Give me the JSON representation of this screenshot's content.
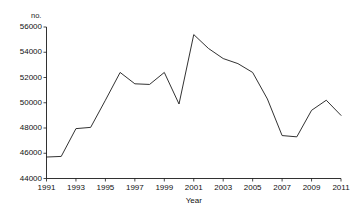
{
  "chart_data": {
    "type": "line",
    "title": "",
    "unit_label": "no.",
    "xlabel": "Year",
    "ylabel": "",
    "x": [
      1991,
      1992,
      1993,
      1994,
      1995,
      1996,
      1997,
      1998,
      1999,
      2000,
      2001,
      2002,
      2003,
      2004,
      2005,
      2006,
      2007,
      2008,
      2009,
      2010,
      2011
    ],
    "categories": [
      "1991",
      "1992",
      "1993",
      "1994",
      "1995",
      "1996",
      "1997",
      "1998",
      "1999",
      "2000",
      "2001",
      "2002",
      "2003",
      "2004",
      "2005",
      "2006",
      "2007",
      "2008",
      "2009",
      "2010",
      "2011"
    ],
    "values": [
      45700,
      45750,
      47950,
      48050,
      50200,
      52400,
      51500,
      51450,
      52400,
      49900,
      55400,
      54300,
      53500,
      53100,
      52400,
      50300,
      47400,
      47300,
      49400,
      50200,
      49000
    ],
    "xtick_labels": [
      "1991",
      "1993",
      "1995",
      "1997",
      "1999",
      "2001",
      "2003",
      "2005",
      "2007",
      "2009",
      "2011"
    ],
    "ytick_labels": [
      "44000",
      "46000",
      "48000",
      "50000",
      "52000",
      "54000",
      "56000"
    ],
    "ylim": [
      44000,
      56000
    ],
    "xlim": [
      1991,
      2011
    ],
    "grid": false,
    "legend": "none",
    "series": [
      {
        "name": "no.",
        "values": [
          45700,
          45750,
          47950,
          48050,
          50200,
          52400,
          51500,
          51450,
          52400,
          49900,
          55400,
          54300,
          53500,
          53100,
          52400,
          50300,
          47400,
          47300,
          49400,
          50200,
          49000
        ]
      }
    ]
  }
}
